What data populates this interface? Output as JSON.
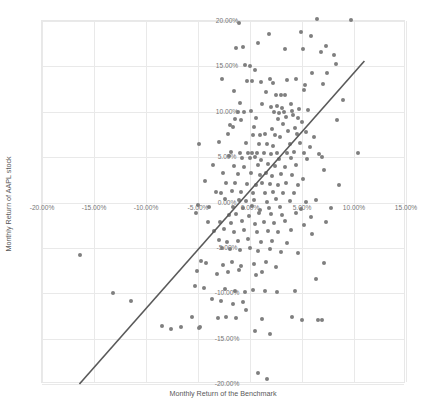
{
  "chart_data": {
    "type": "scatter",
    "title": "",
    "xlabel": "Monthly Return of the Benchmark",
    "ylabel": "Monthly Return of AAPL stock",
    "xlim": [
      -20,
      15
    ],
    "ylim": [
      -20,
      20
    ],
    "grid": true,
    "legend": "none",
    "x_tick_labels": [
      "-20.00%",
      "-15.00%",
      "-10.00%",
      "-5.00%",
      "0.00%",
      "5.00%",
      "10.00%",
      "15.00%"
    ],
    "x_tick_values": [
      -20,
      -15,
      -10,
      -5,
      0,
      5,
      10,
      15
    ],
    "y_tick_labels": [
      "20.00%",
      "15.00%",
      "10.00%",
      "5.00%",
      "0.00%",
      "-5.00%",
      "-10.00%",
      "-15.00%",
      "-20.00%"
    ],
    "y_tick_values": [
      20,
      15,
      10,
      5,
      0,
      -5,
      -10,
      -15,
      -20
    ],
    "marker_color": "#7f7f7f",
    "gridline_color": "#e9e9e9",
    "trendline": {
      "color": "#595959",
      "x0": -16.4,
      "y0": -20.0,
      "x1": 11.0,
      "y1": 15.6
    },
    "series": [
      {
        "name": "AAPL vs Benchmark monthly returns",
        "points": [
          [
            -1.1,
            19.8
          ],
          [
            6.4,
            20.2
          ],
          [
            9.7,
            20.1
          ],
          [
            1.8,
            18.6
          ],
          [
            4.9,
            18.8
          ],
          [
            5.9,
            18.4
          ],
          [
            -1.3,
            17.0
          ],
          [
            -0.7,
            17.1
          ],
          [
            0.8,
            17.6
          ],
          [
            3.4,
            16.9
          ],
          [
            5.1,
            16.9
          ],
          [
            6.8,
            16.6
          ],
          [
            7.3,
            17.2
          ],
          [
            8.1,
            16.2
          ],
          [
            -0.5,
            15.1
          ],
          [
            0.0,
            15.0
          ],
          [
            0.5,
            14.6
          ],
          [
            6.0,
            14.3
          ],
          [
            7.4,
            14.3
          ],
          [
            8.3,
            15.3
          ],
          [
            -2.7,
            13.6
          ],
          [
            -0.3,
            13.4
          ],
          [
            0.2,
            13.4
          ],
          [
            1.1,
            13.3
          ],
          [
            1.9,
            13.6
          ],
          [
            2.2,
            13.2
          ],
          [
            3.6,
            13.5
          ],
          [
            4.4,
            13.6
          ],
          [
            5.3,
            13.0
          ],
          [
            7.0,
            13.1
          ],
          [
            -1.5,
            12.3
          ],
          [
            1.5,
            12.2
          ],
          [
            2.5,
            11.8
          ],
          [
            3.0,
            11.8
          ],
          [
            3.4,
            11.9
          ],
          [
            5.2,
            12.4
          ],
          [
            -1.0,
            11.0
          ],
          [
            1.2,
            10.9
          ],
          [
            2.0,
            10.5
          ],
          [
            2.6,
            10.6
          ],
          [
            3.1,
            10.4
          ],
          [
            3.9,
            10.9
          ],
          [
            8.9,
            11.3
          ],
          [
            -1.2,
            10.0
          ],
          [
            -0.6,
            10.0
          ],
          [
            0.1,
            10.1
          ],
          [
            2.3,
            10.0
          ],
          [
            2.8,
            9.9
          ],
          [
            3.3,
            10.0
          ],
          [
            4.0,
            10.1
          ],
          [
            4.7,
            10.3
          ],
          [
            5.6,
            10.2
          ],
          [
            -1.4,
            9.2
          ],
          [
            -0.9,
            9.1
          ],
          [
            0.6,
            9.3
          ],
          [
            2.7,
            9.2
          ],
          [
            3.5,
            9.4
          ],
          [
            4.1,
            9.6
          ],
          [
            4.6,
            9.3
          ],
          [
            5.0,
            8.9
          ],
          [
            8.4,
            9.1
          ],
          [
            -1.9,
            8.5
          ],
          [
            -1.6,
            8.3
          ],
          [
            0.4,
            8.3
          ],
          [
            2.1,
            8.1
          ],
          [
            3.2,
            8.6
          ],
          [
            4.3,
            8.2
          ],
          [
            -2.1,
            7.5
          ],
          [
            0.3,
            7.4
          ],
          [
            1.0,
            7.4
          ],
          [
            1.4,
            7.6
          ],
          [
            2.4,
            7.4
          ],
          [
            2.9,
            7.2
          ],
          [
            3.7,
            7.9
          ],
          [
            4.5,
            7.5
          ],
          [
            5.4,
            7.8
          ],
          [
            6.2,
            7.2
          ],
          [
            -3.0,
            6.7
          ],
          [
            -0.4,
            6.6
          ],
          [
            0.9,
            6.5
          ],
          [
            1.6,
            6.5
          ],
          [
            2.2,
            6.2
          ],
          [
            3.8,
            6.4
          ],
          [
            4.8,
            6.6
          ],
          [
            5.8,
            6.1
          ],
          [
            -4.9,
            6.5
          ],
          [
            -1.8,
            5.6
          ],
          [
            -1.0,
            5.5
          ],
          [
            -0.2,
            5.5
          ],
          [
            0.2,
            5.4
          ],
          [
            0.7,
            5.5
          ],
          [
            1.3,
            5.4
          ],
          [
            2.0,
            5.3
          ],
          [
            2.6,
            5.4
          ],
          [
            3.6,
            5.5
          ],
          [
            4.2,
            5.6
          ],
          [
            5.2,
            5.4
          ],
          [
            6.6,
            5.3
          ],
          [
            10.4,
            5.4
          ],
          [
            -2.0,
            5.1
          ],
          [
            -0.8,
            4.9
          ],
          [
            0.0,
            4.9
          ],
          [
            0.5,
            5.0
          ],
          [
            1.1,
            4.7
          ],
          [
            2.8,
            4.8
          ],
          [
            3.9,
            4.9
          ],
          [
            5.5,
            4.8
          ],
          [
            6.9,
            5.0
          ],
          [
            -3.6,
            4.1
          ],
          [
            -1.5,
            4.0
          ],
          [
            -0.6,
            3.9
          ],
          [
            0.8,
            4.1
          ],
          [
            1.7,
            4.2
          ],
          [
            2.4,
            4.0
          ],
          [
            3.4,
            3.9
          ],
          [
            4.4,
            4.1
          ],
          [
            7.1,
            3.6
          ],
          [
            -2.6,
            3.2
          ],
          [
            -1.2,
            3.1
          ],
          [
            0.1,
            3.2
          ],
          [
            1.0,
            3.0
          ],
          [
            1.5,
            3.3
          ],
          [
            2.1,
            2.9
          ],
          [
            3.0,
            3.1
          ],
          [
            4.0,
            3.0
          ],
          [
            5.1,
            2.6
          ],
          [
            -4.3,
            2.4
          ],
          [
            -2.3,
            2.1
          ],
          [
            -1.4,
            2.2
          ],
          [
            -0.3,
            2.0
          ],
          [
            0.6,
            1.9
          ],
          [
            1.2,
            2.2
          ],
          [
            1.9,
            2.0
          ],
          [
            2.7,
            1.9
          ],
          [
            3.5,
            2.1
          ],
          [
            4.6,
            1.9
          ],
          [
            8.6,
            1.9
          ],
          [
            -3.3,
            1.2
          ],
          [
            -2.8,
            1.1
          ],
          [
            -1.7,
            1.3
          ],
          [
            -0.9,
            1.2
          ],
          [
            0.3,
            1.1
          ],
          [
            1.4,
            1.0
          ],
          [
            2.2,
            1.2
          ],
          [
            3.2,
            1.1
          ],
          [
            4.2,
            1.0
          ],
          [
            -2.4,
            0.4
          ],
          [
            -1.1,
            0.3
          ],
          [
            -0.4,
            0.2
          ],
          [
            0.4,
            0.3
          ],
          [
            1.6,
            0.1
          ],
          [
            2.5,
            0.4
          ],
          [
            3.8,
            0.2
          ],
          [
            5.4,
            0.1
          ],
          [
            6.3,
            0.3
          ],
          [
            -5.0,
            -0.3
          ],
          [
            -3.9,
            -0.5
          ],
          [
            -1.6,
            -0.5
          ],
          [
            -0.7,
            -0.6
          ],
          [
            0.2,
            -0.4
          ],
          [
            1.0,
            -0.8
          ],
          [
            1.8,
            -0.6
          ],
          [
            2.9,
            -0.5
          ],
          [
            4.9,
            -0.7
          ],
          [
            7.8,
            -0.6
          ],
          [
            -5.2,
            -1.2
          ],
          [
            -2.0,
            -1.4
          ],
          [
            -1.3,
            -1.3
          ],
          [
            -0.1,
            -1.5
          ],
          [
            0.9,
            -1.2
          ],
          [
            2.0,
            -1.3
          ],
          [
            3.1,
            -1.4
          ],
          [
            4.4,
            -1.2
          ],
          [
            5.9,
            -1.6
          ],
          [
            -4.0,
            -2.1
          ],
          [
            -2.9,
            -2.2
          ],
          [
            -1.8,
            -2.3
          ],
          [
            -0.8,
            -2.0
          ],
          [
            0.5,
            -2.4
          ],
          [
            1.3,
            -2.1
          ],
          [
            2.3,
            -2.3
          ],
          [
            3.4,
            -2.0
          ],
          [
            5.2,
            -2.5
          ],
          [
            7.3,
            -2.2
          ],
          [
            -3.5,
            -3.1
          ],
          [
            -2.5,
            -2.9
          ],
          [
            -1.5,
            -3.2
          ],
          [
            -0.6,
            -3.0
          ],
          [
            0.7,
            -3.2
          ],
          [
            1.7,
            -3.1
          ],
          [
            2.7,
            -3.3
          ],
          [
            3.9,
            -3.0
          ],
          [
            6.0,
            -3.5
          ],
          [
            -3.0,
            -4.1
          ],
          [
            -2.2,
            -4.3
          ],
          [
            -1.2,
            -4.2
          ],
          [
            -0.2,
            -4.0
          ],
          [
            1.1,
            -4.4
          ],
          [
            2.1,
            -4.2
          ],
          [
            3.6,
            -4.5
          ],
          [
            -2.7,
            -5.0
          ],
          [
            -1.9,
            -5.1
          ],
          [
            -1.0,
            -5.2
          ],
          [
            0.0,
            -5.0
          ],
          [
            0.8,
            -5.3
          ],
          [
            1.9,
            -5.1
          ],
          [
            3.0,
            -5.4
          ],
          [
            4.6,
            -5.6
          ],
          [
            -16.3,
            -5.8
          ],
          [
            -4.7,
            -6.5
          ],
          [
            -4.2,
            -6.7
          ],
          [
            -2.6,
            -6.9
          ],
          [
            -1.7,
            -6.6
          ],
          [
            -0.9,
            -7.0
          ],
          [
            0.4,
            -6.8
          ],
          [
            1.5,
            -6.6
          ],
          [
            2.5,
            -7.1
          ],
          [
            7.1,
            -6.7
          ],
          [
            -5.1,
            -7.6
          ],
          [
            -3.2,
            -7.9
          ],
          [
            -2.1,
            -7.7
          ],
          [
            -1.1,
            -7.4
          ],
          [
            0.6,
            -8.0
          ],
          [
            1.2,
            -7.7
          ],
          [
            6.3,
            -8.4
          ],
          [
            -13.2,
            -10.0
          ],
          [
            -5.3,
            -9.2
          ],
          [
            -4.4,
            -9.4
          ],
          [
            -2.4,
            -9.5
          ],
          [
            -1.4,
            -9.7
          ],
          [
            -0.5,
            -9.9
          ],
          [
            0.3,
            -9.6
          ],
          [
            1.4,
            -9.8
          ],
          [
            2.6,
            -9.9
          ],
          [
            4.3,
            -9.7
          ],
          [
            -11.4,
            -10.8
          ],
          [
            -3.7,
            -10.6
          ],
          [
            -2.8,
            -10.9
          ],
          [
            -1.6,
            -11.2
          ],
          [
            -0.7,
            -11.0
          ],
          [
            -0.4,
            -11.8
          ],
          [
            -5.6,
            -12.6
          ],
          [
            -3.1,
            -12.7
          ],
          [
            -2.3,
            -12.6
          ],
          [
            -1.3,
            -12.7
          ],
          [
            1.2,
            -12.8
          ],
          [
            4.0,
            -12.6
          ],
          [
            5.0,
            -13.0
          ],
          [
            6.5,
            -12.9
          ],
          [
            6.9,
            -12.9
          ],
          [
            -8.5,
            -13.6
          ],
          [
            -7.6,
            -13.9
          ],
          [
            -6.6,
            -13.7
          ],
          [
            -4.9,
            -13.8
          ],
          [
            -4.8,
            -13.7
          ],
          [
            0.5,
            -14.2
          ],
          [
            1.9,
            -14.5
          ],
          [
            0.8,
            -18.8
          ],
          [
            1.6,
            -19.5
          ]
        ]
      }
    ]
  }
}
